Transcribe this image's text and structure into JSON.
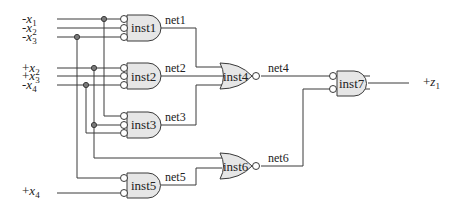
{
  "diagram": {
    "type": "logic-circuit",
    "inputs": [
      {
        "id": "in_nx1",
        "sign": "-",
        "var": "x",
        "sub": "1",
        "y": 19
      },
      {
        "id": "in_nx2",
        "sign": "-",
        "var": "x",
        "sub": "2",
        "y": 28
      },
      {
        "id": "in_nx3",
        "sign": "-",
        "var": "x",
        "sub": "3",
        "y": 37
      },
      {
        "id": "in_px2",
        "sign": "+",
        "var": "x",
        "sub": "2",
        "y": 68
      },
      {
        "id": "in_px3",
        "sign": "+",
        "var": "x",
        "sub": "3",
        "y": 76
      },
      {
        "id": "in_nx4",
        "sign": "-",
        "var": "x",
        "sub": "4",
        "y": 85
      },
      {
        "id": "in_px4",
        "sign": "+",
        "var": "x",
        "sub": "4",
        "y": 193
      }
    ],
    "output": {
      "sign": "+",
      "var": "z",
      "sub": "1"
    },
    "gates": [
      {
        "id": "inst1",
        "label": "inst1",
        "kind": "AND",
        "inverted_inputs": 3
      },
      {
        "id": "inst2",
        "label": "inst2",
        "kind": "AND",
        "inverted_inputs": 3
      },
      {
        "id": "inst3",
        "label": "inst3",
        "kind": "AND",
        "inverted_inputs": 3
      },
      {
        "id": "inst4",
        "label": "inst4",
        "kind": "NOR",
        "inverted_inputs": 0
      },
      {
        "id": "inst5",
        "label": "inst5",
        "kind": "AND",
        "inverted_inputs": 2
      },
      {
        "id": "inst6",
        "label": "inst6",
        "kind": "NOR",
        "inverted_inputs": 0
      },
      {
        "id": "inst7",
        "label": "inst7",
        "kind": "AND",
        "inverted_inputs": 2
      }
    ],
    "nets": [
      {
        "id": "net1",
        "label": "net1",
        "from": "inst1",
        "to": "inst4"
      },
      {
        "id": "net2",
        "label": "net2",
        "from": "inst2",
        "to": "inst4"
      },
      {
        "id": "net3",
        "label": "net3",
        "from": "inst3",
        "to": "inst4"
      },
      {
        "id": "net4",
        "label": "net4",
        "from": "inst4",
        "to": "inst7"
      },
      {
        "id": "net5",
        "label": "net5",
        "from": "inst5",
        "to": "inst6"
      },
      {
        "id": "net6",
        "label": "net6",
        "from": "inst6",
        "to": "inst7"
      }
    ],
    "colors": {
      "wire": "#3a3a3a",
      "gate_fill": "#e6e6e6",
      "junction": "#7a7a7a"
    }
  }
}
